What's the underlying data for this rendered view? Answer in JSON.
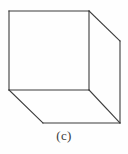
{
  "figure": {
    "caption": "(c)",
    "background_color": "#fefefe",
    "stroke_color": "#3b3b3b",
    "stroke_width": 1.1,
    "shape": {
      "name": "cube-wireframe-visible-edges",
      "description": "Line drawing of a cube in oblique projection: a front square face with receding edges going up-right and down-right",
      "vertices": {
        "front_top_left": [
          9,
          11
        ],
        "front_top_right": [
          89,
          11
        ],
        "front_bottom_left": [
          9,
          90
        ],
        "front_bottom_right": [
          89,
          90
        ],
        "back_top_right": [
          120,
          41
        ],
        "back_bottom_right": [
          120,
          123
        ],
        "back_bottom_left": [
          43,
          123
        ]
      },
      "edges": [
        {
          "name": "front-top-edge",
          "from": [
            9,
            11
          ],
          "to": [
            89,
            11
          ]
        },
        {
          "name": "front-left-edge",
          "from": [
            9,
            11
          ],
          "to": [
            9,
            90
          ]
        },
        {
          "name": "front-bottom-edge",
          "from": [
            9,
            90
          ],
          "to": [
            89,
            90
          ]
        },
        {
          "name": "front-right-edge",
          "from": [
            89,
            11
          ],
          "to": [
            89,
            90
          ]
        },
        {
          "name": "top-receding-edge",
          "from": [
            89,
            11
          ],
          "to": [
            120,
            41
          ]
        },
        {
          "name": "back-right-vertical-edge",
          "from": [
            120,
            41
          ],
          "to": [
            120,
            123
          ]
        },
        {
          "name": "bottom-right-receding-edge",
          "from": [
            89,
            90
          ],
          "to": [
            120,
            123
          ]
        },
        {
          "name": "bottom-left-receding-edge",
          "from": [
            9,
            90
          ],
          "to": [
            43,
            123
          ]
        },
        {
          "name": "back-bottom-edge",
          "from": [
            43,
            123
          ],
          "to": [
            120,
            123
          ]
        }
      ]
    }
  }
}
